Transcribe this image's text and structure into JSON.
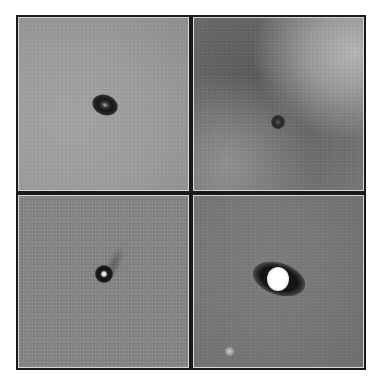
{
  "figure": {
    "layout": "2x2 grid",
    "panels": [
      {
        "id": "top-left",
        "description": "Dark elliptical spot with faint bright core on light gray background",
        "background": "#9a9a9a",
        "spot_color": "#1c1c1c",
        "core_color": "#b0b0b0"
      },
      {
        "id": "top-right",
        "description": "Small dark spot on mottled gray background with lighter upper-right region",
        "background": "#6e6e6e",
        "spot_color": "#2a2a2a",
        "core_color": "#6a6a6a"
      },
      {
        "id": "bottom-left",
        "description": "Small dark spot with bright white center on noisy medium-gray background",
        "background": "#858585",
        "spot_color": "#151515",
        "core_color": "#f0f0f0"
      },
      {
        "id": "bottom-right",
        "description": "Bright white elliptical core flanked by dark lobes on gray background; faint bright dot lower-left",
        "background": "#787878",
        "spot_color": "#141414",
        "core_color": "#ffffff",
        "secondary_dot_color": "#bdbdbd"
      }
    ],
    "colors": {
      "frame": "#1a1a1a",
      "panel_inner_border": "#d8d8d8",
      "page_background": "#ffffff"
    }
  }
}
